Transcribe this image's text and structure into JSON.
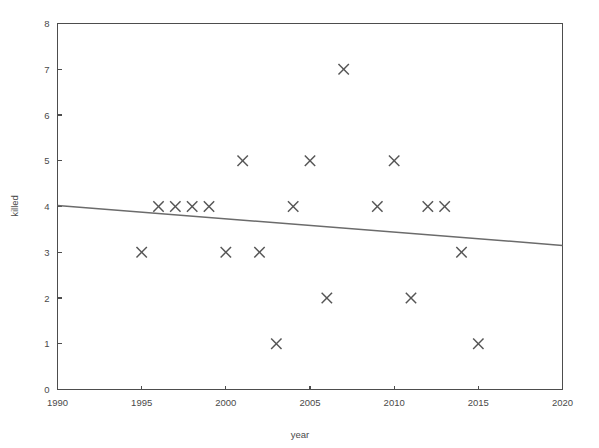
{
  "chart_data": {
    "type": "scatter",
    "title": "",
    "xlabel": "year",
    "ylabel": "killed",
    "xlim": [
      1990,
      2020
    ],
    "ylim": [
      0,
      8
    ],
    "grid": false,
    "legend": null,
    "x_ticks": [
      1990,
      1995,
      2000,
      2005,
      2010,
      2015,
      2020
    ],
    "y_ticks": [
      0,
      1,
      2,
      3,
      4,
      5,
      6,
      7,
      8
    ],
    "x_tick_labels": [
      "1990",
      "1995",
      "2000",
      "2005",
      "2010",
      "2015",
      "2020"
    ],
    "y_tick_labels": [
      "0",
      "1",
      "2",
      "3",
      "4",
      "5",
      "6",
      "7",
      "8"
    ],
    "marker_symbol": "x",
    "marker_color": "#555555",
    "axis_color": "#4d4d4d",
    "series": [
      {
        "name": "killed",
        "type": "scatter",
        "points": [
          {
            "x": 1995,
            "y": 3
          },
          {
            "x": 1996,
            "y": 4
          },
          {
            "x": 1997,
            "y": 4
          },
          {
            "x": 1998,
            "y": 4
          },
          {
            "x": 1999,
            "y": 4
          },
          {
            "x": 2000,
            "y": 3
          },
          {
            "x": 2001,
            "y": 5
          },
          {
            "x": 2002,
            "y": 3
          },
          {
            "x": 2003,
            "y": 1
          },
          {
            "x": 2004,
            "y": 4
          },
          {
            "x": 2005,
            "y": 5
          },
          {
            "x": 2006,
            "y": 2
          },
          {
            "x": 2007,
            "y": 7
          },
          {
            "x": 2009,
            "y": 4
          },
          {
            "x": 2010,
            "y": 5
          },
          {
            "x": 2011,
            "y": 2
          },
          {
            "x": 2012,
            "y": 4
          },
          {
            "x": 2013,
            "y": 4
          },
          {
            "x": 2014,
            "y": 3
          },
          {
            "x": 2015,
            "y": 1
          }
        ]
      },
      {
        "name": "trend-line",
        "type": "line",
        "color": "#6b6b6b",
        "points": [
          {
            "x": 1990,
            "y": 4.02
          },
          {
            "x": 2020,
            "y": 3.15
          }
        ]
      }
    ]
  }
}
